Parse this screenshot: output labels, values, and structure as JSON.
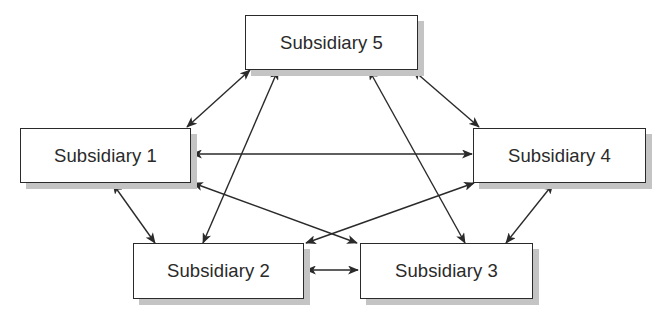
{
  "diagram": {
    "type": "network",
    "nodes": [
      {
        "id": "s5",
        "label": "Subsidiary 5",
        "x": 245,
        "y": 15,
        "w": 173,
        "h": 55
      },
      {
        "id": "s1",
        "label": "Subsidiary 1",
        "x": 20,
        "y": 128,
        "w": 171,
        "h": 55
      },
      {
        "id": "s4",
        "label": "Subsidiary 4",
        "x": 473,
        "y": 128,
        "w": 173,
        "h": 55
      },
      {
        "id": "s2",
        "label": "Subsidiary 2",
        "x": 133,
        "y": 243,
        "w": 171,
        "h": 56
      },
      {
        "id": "s3",
        "label": "Subsidiary 3",
        "x": 360,
        "y": 243,
        "w": 173,
        "h": 56
      }
    ],
    "edges": [
      {
        "from": "s5",
        "to": "s1",
        "x1": 250,
        "y1": 70,
        "x2": 187,
        "y2": 127,
        "direction": "both"
      },
      {
        "from": "s5",
        "to": "s2",
        "x1": 278,
        "y1": 70,
        "x2": 203,
        "y2": 243,
        "direction": "both"
      },
      {
        "from": "s5",
        "to": "s3",
        "x1": 369,
        "y1": 70,
        "x2": 465,
        "y2": 243,
        "direction": "both"
      },
      {
        "from": "s5",
        "to": "s4",
        "x1": 413,
        "y1": 70,
        "x2": 479,
        "y2": 127,
        "direction": "both"
      },
      {
        "from": "s1",
        "to": "s4",
        "x1": 192,
        "y1": 154,
        "x2": 472,
        "y2": 154,
        "direction": "both"
      },
      {
        "from": "s1",
        "to": "s3",
        "x1": 193,
        "y1": 183,
        "x2": 357,
        "y2": 243,
        "direction": "both"
      },
      {
        "from": "s4",
        "to": "s2",
        "x1": 474,
        "y1": 183,
        "x2": 306,
        "y2": 243,
        "direction": "both"
      },
      {
        "from": "s1",
        "to": "s2",
        "x1": 113,
        "y1": 184,
        "x2": 155,
        "y2": 243,
        "direction": "both"
      },
      {
        "from": "s4",
        "to": "s3",
        "x1": 553,
        "y1": 184,
        "x2": 506,
        "y2": 243,
        "direction": "both"
      },
      {
        "from": "s2",
        "to": "s3",
        "x1": 306,
        "y1": 270,
        "x2": 358,
        "y2": 270,
        "direction": "both"
      }
    ],
    "colors": {
      "stroke": "#2a2a2a",
      "shadow": "#c4c4c4",
      "text": "#2a2a2a"
    }
  }
}
